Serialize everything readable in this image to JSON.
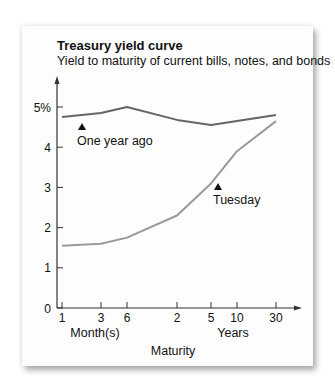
{
  "chart_data": {
    "type": "line",
    "title": "Treasury yield curve",
    "subtitle": "Yield to maturity of current bills, notes, and bonds",
    "xlabel": "Maturity",
    "x_group_labels": [
      "Month(s)",
      "Years"
    ],
    "ylabel": "",
    "ylim": [
      0,
      5.5
    ],
    "y_ticks": [
      "0",
      "1",
      "2",
      "3",
      "4",
      "5%"
    ],
    "categories": [
      "1 mo",
      "3 mo",
      "6 mo",
      "2 yr",
      "5 yr",
      "10 yr",
      "30 yr"
    ],
    "x_tick_labels": [
      "1",
      "3",
      "6",
      "2",
      "5",
      "10",
      "30"
    ],
    "grid": false,
    "legend": "inline annotations",
    "series": [
      {
        "name": "One year ago",
        "color": "#666666",
        "values": [
          4.75,
          4.85,
          5.0,
          4.68,
          4.55,
          4.65,
          4.8
        ]
      },
      {
        "name": "Tuesday",
        "color": "#9a9a9a",
        "values": [
          1.55,
          1.6,
          1.75,
          2.3,
          3.1,
          3.9,
          4.65
        ]
      }
    ],
    "annotations": [
      {
        "text": "One year ago",
        "marker": "triangle-up"
      },
      {
        "text": "Tuesday",
        "marker": "triangle-up"
      }
    ]
  },
  "labels": {
    "title": "Treasury yield curve",
    "subtitle": "Yield to maturity of current bills, notes, and bonds",
    "months": "Month(s)",
    "years": "Years",
    "maturity": "Maturity",
    "one_year_ago": "One year ago",
    "tuesday": "Tuesday"
  }
}
